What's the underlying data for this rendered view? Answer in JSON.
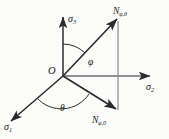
{
  "figure": {
    "type": "3d-axis-vector-diagram",
    "background_color": "#fbfbfa",
    "line_color": "#2b2b2b",
    "origin_label": "O",
    "axes": [
      {
        "name": "sigma-3",
        "base": "σ",
        "sub": "3",
        "direction": "up"
      },
      {
        "name": "sigma-2",
        "base": "σ",
        "sub": "2",
        "direction": "right"
      },
      {
        "name": "sigma-1",
        "base": "σ",
        "sub": "1",
        "direction": "down-left"
      }
    ],
    "vectors": [
      {
        "name": "N-phi-theta",
        "base": "N",
        "sub": "φ,θ",
        "direction": "up-right"
      },
      {
        "name": "N-phi-zero",
        "base": "N",
        "sub": "φ,0",
        "direction": "down-right"
      }
    ],
    "angles": [
      {
        "name": "phi",
        "symbol": "φ",
        "between": "sigma-3 and N-phi-theta"
      },
      {
        "name": "theta",
        "symbol": "θ",
        "between": "sigma-1 and N-phi-zero"
      }
    ]
  }
}
